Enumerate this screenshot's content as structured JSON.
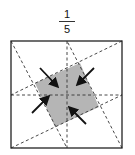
{
  "label": {
    "numerator": "1",
    "denominator": "5"
  },
  "colors": {
    "outline": "#222222",
    "dash": "#333333",
    "shaded": "#b5b5b5",
    "arrow": "#111111"
  },
  "diagram": {
    "outer_square": {
      "x1": 11,
      "y1": 41,
      "x2": 122,
      "y2": 148
    },
    "inner_square": [
      [
        35,
        83
      ],
      [
        80,
        63
      ],
      [
        99,
        107
      ],
      [
        55,
        127
      ]
    ],
    "dashed_lines": [
      {
        "x1": 67,
        "y1": 41,
        "x2": 67,
        "y2": 148
      },
      {
        "x1": 11,
        "y1": 95,
        "x2": 122,
        "y2": 95
      },
      {
        "x1": 11,
        "y1": 41,
        "x2": 67,
        "y2": 148
      },
      {
        "x1": 122,
        "y1": 41,
        "x2": 11,
        "y2": 95
      },
      {
        "x1": 122,
        "y1": 148,
        "x2": 67,
        "y2": 41
      },
      {
        "x1": 11,
        "y1": 148,
        "x2": 122,
        "y2": 95
      }
    ],
    "arrows": [
      {
        "from": [
          40,
          68
        ],
        "to": [
          57,
          86
        ]
      },
      {
        "from": [
          94,
          68
        ],
        "to": [
          78,
          84
        ]
      },
      {
        "from": [
          32,
          113
        ],
        "to": [
          48,
          97
        ]
      },
      {
        "from": [
          86,
          124
        ],
        "to": [
          70,
          108
        ]
      }
    ]
  }
}
